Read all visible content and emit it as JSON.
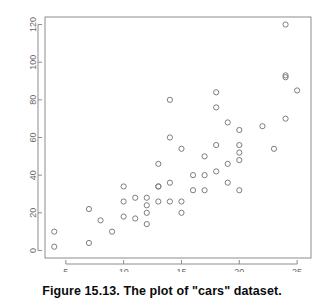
{
  "caption": {
    "text": "Figure 15.13.   The plot of \"cars\" dataset."
  },
  "colors": {
    "background": "#ffffff",
    "frame": "#8c8c8c",
    "point_stroke": "#7d7d7d",
    "tick_label": "#6a6a6a",
    "caption_text": "#0b0b0b"
  },
  "chart_data": {
    "type": "scatter",
    "title": "",
    "xlabel": "",
    "ylabel": "",
    "xlim": [
      3.2,
      26.2
    ],
    "ylim": [
      -4,
      124
    ],
    "xticks": [
      5,
      10,
      15,
      20,
      25
    ],
    "yticks": [
      0,
      20,
      40,
      60,
      80,
      100,
      120
    ],
    "xtick_labels": [
      "5",
      "10",
      "15",
      "20",
      "25"
    ],
    "ytick_labels": [
      "0",
      "20",
      "40",
      "60",
      "80",
      "100",
      "120"
    ],
    "grid": false,
    "legend": null,
    "marker": "open-circle",
    "series": [
      {
        "name": "cars",
        "x": [
          4,
          4,
          7,
          7,
          8,
          9,
          10,
          10,
          10,
          11,
          11,
          12,
          12,
          12,
          12,
          13,
          13,
          13,
          13,
          14,
          14,
          14,
          14,
          15,
          15,
          15,
          16,
          16,
          17,
          17,
          17,
          18,
          18,
          18,
          18,
          19,
          19,
          19,
          20,
          20,
          20,
          20,
          20,
          22,
          23,
          24,
          24,
          24,
          24,
          25
        ],
        "y": [
          2,
          10,
          4,
          22,
          16,
          10,
          18,
          26,
          34,
          17,
          28,
          14,
          20,
          24,
          28,
          26,
          34,
          34,
          46,
          26,
          36,
          60,
          80,
          20,
          26,
          54,
          32,
          40,
          32,
          40,
          50,
          42,
          56,
          76,
          84,
          36,
          46,
          68,
          32,
          48,
          52,
          56,
          64,
          66,
          54,
          70,
          92,
          93,
          120,
          85
        ]
      }
    ]
  }
}
